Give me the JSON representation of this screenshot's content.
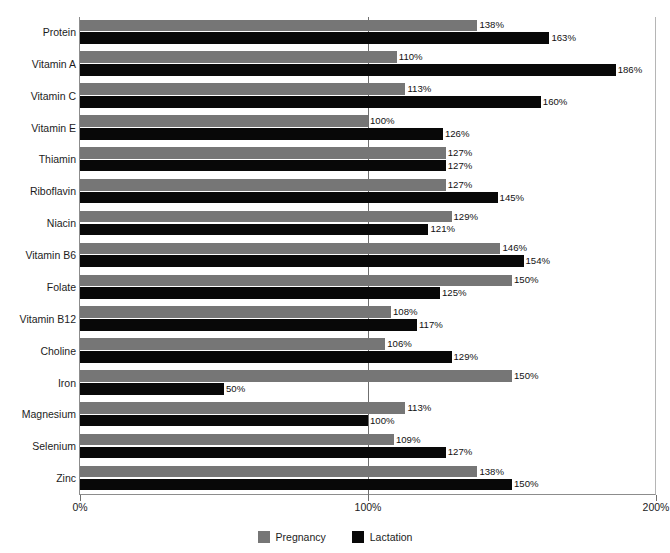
{
  "chart_data": {
    "type": "bar",
    "orientation": "horizontal",
    "title": "",
    "xlabel": "",
    "ylabel": "",
    "xlim": [
      0,
      200
    ],
    "xticks": [
      0,
      100,
      200
    ],
    "xticklabels": [
      "0%",
      "100%",
      "200%"
    ],
    "grid": "vertical gridline at 100%",
    "legend_position": "bottom-center",
    "categories": [
      "Protein",
      "Vitamin A",
      "Vitamin C",
      "Vitamin E",
      "Thiamin",
      "Riboflavin",
      "Niacin",
      "Vitamin B6",
      "Folate",
      "Vitamin B12",
      "Choline",
      "Iron",
      "Magnesium",
      "Selenium",
      "Zinc"
    ],
    "series": [
      {
        "name": "Pregnancy",
        "color": "#767676",
        "values": [
          138,
          110,
          113,
          100,
          127,
          127,
          129,
          146,
          150,
          108,
          106,
          150,
          113,
          109,
          138
        ],
        "labels": [
          "138%",
          "110%",
          "113%",
          "100%",
          "127%",
          "127%",
          "129%",
          "146%",
          "150%",
          "108%",
          "106%",
          "150%",
          "113%",
          "109%",
          "138%"
        ]
      },
      {
        "name": "Lactation",
        "color": "#080808",
        "values": [
          163,
          186,
          160,
          126,
          127,
          145,
          121,
          154,
          125,
          117,
          129,
          50,
          100,
          127,
          150
        ],
        "labels": [
          "163%",
          "186%",
          "160%",
          "126%",
          "127%",
          "145%",
          "121%",
          "154%",
          "125%",
          "117%",
          "129%",
          "50%",
          "100%",
          "127%",
          "150%"
        ]
      }
    ]
  },
  "legend": {
    "items": [
      {
        "label": "Pregnancy",
        "color": "#767676"
      },
      {
        "label": "Lactation",
        "color": "#080808"
      }
    ]
  }
}
